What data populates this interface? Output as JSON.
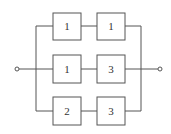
{
  "diagram": {
    "type": "reliability-block-diagram",
    "branches": [
      {
        "name": "top",
        "blocks": [
          {
            "label": "1"
          },
          {
            "label": "1"
          }
        ]
      },
      {
        "name": "middle",
        "blocks": [
          {
            "label": "1"
          },
          {
            "label": "3"
          }
        ]
      },
      {
        "name": "bottom",
        "blocks": [
          {
            "label": "2"
          },
          {
            "label": "3"
          }
        ]
      }
    ],
    "terminals": {
      "input": "input-terminal",
      "output": "output-terminal"
    },
    "colors": {
      "line": "#555555",
      "background": "#ffffff",
      "text": "#333333"
    }
  }
}
